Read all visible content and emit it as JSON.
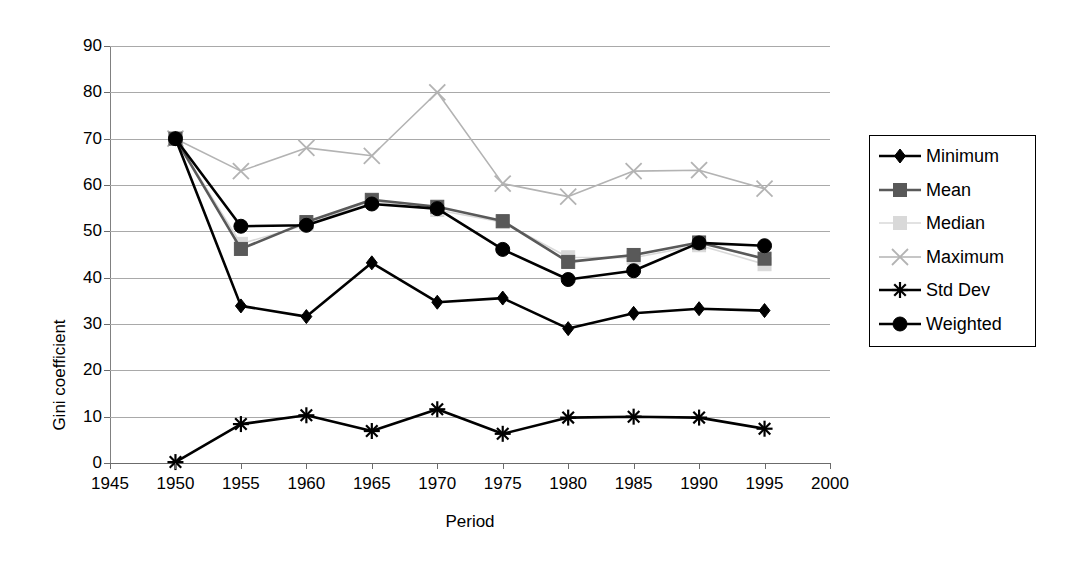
{
  "chart_data": {
    "type": "line",
    "title": "",
    "xlabel": "Period",
    "ylabel": "Gini coefficient",
    "x": [
      1950,
      1955,
      1960,
      1965,
      1970,
      1975,
      1980,
      1985,
      1990,
      1995
    ],
    "xlim": [
      1945,
      2000
    ],
    "ylim": [
      0,
      90
    ],
    "xticks": [
      1945,
      1950,
      1955,
      1960,
      1965,
      1970,
      1975,
      1980,
      1985,
      1990,
      1995,
      2000
    ],
    "yticks": [
      0,
      10,
      20,
      30,
      40,
      50,
      60,
      70,
      80,
      90
    ],
    "grid": true,
    "legend_position": "right",
    "series": [
      {
        "name": "Minimum",
        "marker": "diamond",
        "color": "#000000",
        "values": [
          70.0,
          33.9,
          31.6,
          43.2,
          34.7,
          35.6,
          29.0,
          32.3,
          33.3,
          32.9
        ]
      },
      {
        "name": "Mean",
        "marker": "square",
        "color": "#595959",
        "values": [
          70.0,
          46.2,
          52.0,
          56.8,
          55.3,
          52.2,
          43.4,
          44.9,
          47.6,
          44.1
        ]
      },
      {
        "name": "Median",
        "marker": "square",
        "color": "#d9d9d9",
        "values": [
          70.0,
          47.3,
          51.4,
          56.6,
          54.6,
          52.0,
          44.4,
          44.3,
          47.0,
          42.9
        ]
      },
      {
        "name": "Maximum",
        "marker": "cross",
        "color": "#b3b3b3",
        "values": [
          70.0,
          63.0,
          68.0,
          66.3,
          80.0,
          60.3,
          57.5,
          63.0,
          63.2,
          59.2
        ]
      },
      {
        "name": "Std Dev",
        "marker": "star",
        "color": "#000000",
        "values": [
          0.2,
          8.4,
          10.3,
          6.9,
          11.6,
          6.3,
          9.8,
          10.0,
          9.8,
          7.4
        ]
      },
      {
        "name": "Weighted",
        "marker": "circle",
        "color": "#000000",
        "values": [
          70.0,
          51.1,
          51.3,
          55.9,
          54.9,
          46.1,
          39.6,
          41.5,
          47.5,
          46.9
        ]
      }
    ]
  },
  "axes": {
    "y_title": "Gini coefficient",
    "x_title": "Period",
    "y_tick_labels": [
      "90",
      "80",
      "70",
      "60",
      "50",
      "40",
      "30",
      "20",
      "10",
      "0"
    ],
    "x_tick_labels": [
      "1945",
      "1950",
      "1955",
      "1960",
      "1965",
      "1970",
      "1975",
      "1980",
      "1985",
      "1990",
      "1995",
      "2000"
    ]
  },
  "legend": {
    "items": [
      {
        "label": "Minimum"
      },
      {
        "label": "Mean"
      },
      {
        "label": "Median"
      },
      {
        "label": "Maximum"
      },
      {
        "label": "Std Dev"
      },
      {
        "label": "Weighted"
      }
    ]
  }
}
